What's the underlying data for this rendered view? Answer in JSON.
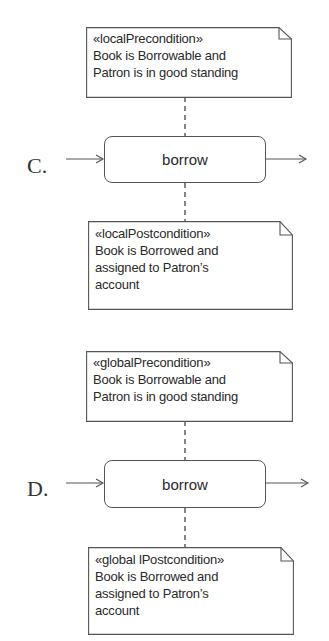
{
  "options": [
    {
      "label": "C.",
      "precondition": {
        "stereotype": "«localPrecondition»",
        "lines": [
          "Book is Borrowable and",
          "Patron is in good standing"
        ]
      },
      "action": "borrow",
      "postcondition": {
        "stereotype": "«localPostcondition»",
        "lines": [
          "Book is Borrowed and",
          "assigned to Patron’s",
          "account"
        ]
      }
    },
    {
      "label": "D.",
      "precondition": {
        "stereotype": "«globalPrecondition»",
        "lines": [
          "Book is Borrowable and",
          "Patron is in good standing"
        ]
      },
      "action": "borrow",
      "postcondition": {
        "stereotype": "«global lPostcondition»",
        "lines": [
          "Book is Borrowed and",
          "assigned to Patron’s",
          "account"
        ]
      }
    }
  ],
  "colors": {
    "line": "#555555",
    "text": "#2a2a2a",
    "background": "#ffffff"
  }
}
